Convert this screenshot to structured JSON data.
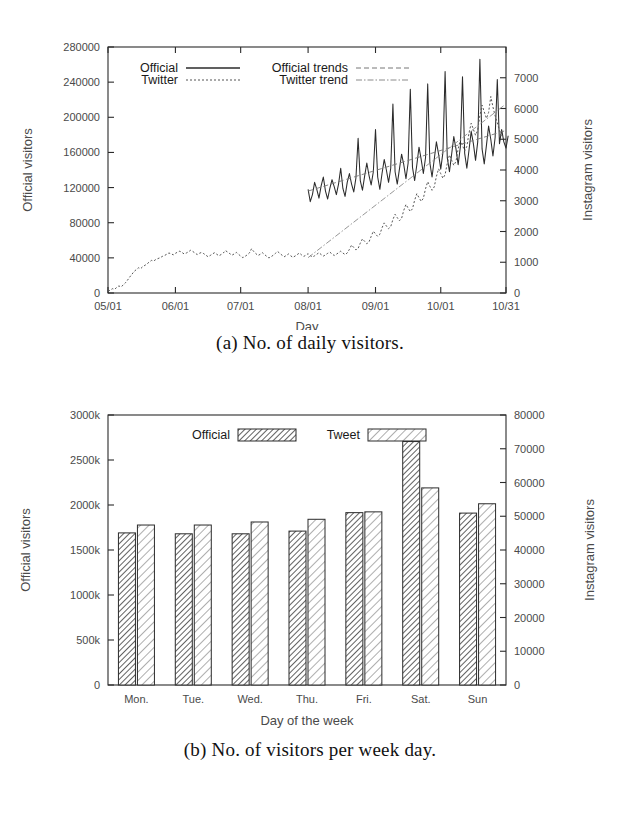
{
  "figure_a": {
    "caption": "(a) No. of daily visitors.",
    "legend": [
      {
        "label": "Official",
        "style": "solid"
      },
      {
        "label": "Twitter",
        "style": "dotted"
      },
      {
        "label": "Official trends",
        "style": "dashed"
      },
      {
        "label": "Twitter trend",
        "style": "dash-dot"
      }
    ],
    "chart_data": {
      "type": "line",
      "title": "",
      "xlabel": "Day",
      "ylabel": "Official visitors",
      "y2label": "Instagram visitors",
      "xtick_labels": [
        "05/01",
        "06/01",
        "07/01",
        "08/01",
        "09/01",
        "10/01",
        "10/31"
      ],
      "xtick_positions": [
        0,
        31,
        61,
        92,
        123,
        153,
        183
      ],
      "xlim": [
        0,
        183
      ],
      "ylim": [
        0,
        280000
      ],
      "ytick_labels": [
        "0",
        "40000",
        "80000",
        "120000",
        "160000",
        "200000",
        "240000",
        "280000"
      ],
      "ytick_values": [
        0,
        40000,
        80000,
        120000,
        160000,
        200000,
        240000,
        280000
      ],
      "y2lim": [
        0,
        8000
      ],
      "y2tick_labels": [
        "0",
        "1000",
        "2000",
        "3000",
        "4000",
        "5000",
        "6000",
        "7000"
      ],
      "y2tick_values": [
        0,
        1000,
        2000,
        3000,
        4000,
        5000,
        6000,
        7000
      ],
      "grid": false,
      "legend_position": "top-left-inside",
      "series": [
        {
          "name": "Official",
          "axis": "left",
          "style": "solid",
          "x_start": 92,
          "values": [
            118000,
            104000,
            112000,
            126000,
            118000,
            108000,
            122000,
            132000,
            116000,
            107000,
            119000,
            129000,
            121000,
            112000,
            124000,
            142000,
            119000,
            110000,
            126000,
            136000,
            124000,
            115000,
            131000,
            176000,
            128000,
            117000,
            133000,
            148000,
            134000,
            123000,
            138000,
            186000,
            132000,
            118000,
            136000,
            152000,
            140000,
            126000,
            142000,
            215000,
            138000,
            124000,
            141000,
            158000,
            146000,
            130000,
            148000,
            232000,
            143000,
            128000,
            146000,
            166000,
            152000,
            136000,
            154000,
            238000,
            148000,
            132000,
            152000,
            172000,
            158000,
            141000,
            160000,
            252000,
            154000,
            138000,
            158000,
            178000,
            164000,
            146000,
            166000,
            246000,
            159000,
            142000,
            163000,
            184000,
            170000,
            151000,
            172000,
            266000,
            164000,
            147000,
            168000,
            190000,
            175000,
            156000,
            177000,
            243000,
            170000,
            186000,
            172000,
            165000,
            179000
          ]
        },
        {
          "name": "Twitter",
          "axis": "right",
          "style": "dotted",
          "x_start": 0,
          "values": [
            60,
            90,
            140,
            120,
            180,
            230,
            200,
            260,
            330,
            420,
            520,
            610,
            700,
            760,
            820,
            790,
            860,
            900,
            950,
            1010,
            1060,
            1040,
            1090,
            1120,
            1150,
            1190,
            1220,
            1260,
            1300,
            1280,
            1240,
            1290,
            1330,
            1360,
            1320,
            1270,
            1300,
            1340,
            1390,
            1350,
            1300,
            1250,
            1290,
            1320,
            1280,
            1230,
            1180,
            1220,
            1270,
            1310,
            1260,
            1210,
            1250,
            1300,
            1380,
            1330,
            1280,
            1230,
            1270,
            1320,
            1260,
            1200,
            1150,
            1190,
            1240,
            1300,
            1440,
            1350,
            1280,
            1220,
            1260,
            1310,
            1250,
            1190,
            1140,
            1180,
            1230,
            1290,
            1350,
            1290,
            1230,
            1180,
            1220,
            1270,
            1210,
            1160,
            1200,
            1250,
            1300,
            1240,
            1190,
            1230,
            1280,
            1220,
            1170,
            1210,
            1260,
            1310,
            1250,
            1200,
            1240,
            1290,
            1330,
            1270,
            1220,
            1260,
            1310,
            1360,
            1300,
            1250,
            1300,
            1420,
            1560,
            1480,
            1400,
            1450,
            1620,
            1760,
            1680,
            1600,
            1660,
            1840,
            2010,
            1920,
            1840,
            1910,
            2120,
            2280,
            2180,
            2090,
            2160,
            2390,
            2560,
            2450,
            2350,
            2430,
            2690,
            2880,
            2760,
            2650,
            2740,
            3020,
            3230,
            3100,
            2980,
            3080,
            3390,
            3620,
            3470,
            3340,
            3450,
            3790,
            4040,
            3880,
            3730,
            3850,
            4220,
            4490,
            4320,
            4150,
            4280,
            4690,
            4980,
            4800,
            4620,
            4770,
            5210,
            5520,
            5320,
            5130,
            5300,
            5780,
            6110,
            5890,
            5680,
            5870,
            6390,
            6050,
            5760,
            5540,
            5290,
            5060
          ]
        }
      ],
      "trends": [
        {
          "name": "Official trends",
          "axis": "left",
          "style": "dashed",
          "x_start": 92,
          "x_end": 183,
          "y_start": 116000,
          "y_end": 185000
        },
        {
          "name": "Twitter trend",
          "axis": "right",
          "style": "dash-dot",
          "x_start": 92,
          "x_end": 183,
          "y_start": 1150,
          "y_end": 6150
        }
      ]
    }
  },
  "figure_b": {
    "caption": "(b) No. of visitors per week day.",
    "legend": [
      {
        "label": "Official",
        "pattern": "dense-hatch"
      },
      {
        "label": "Tweet",
        "pattern": "sparse-hatch"
      }
    ],
    "chart_data": {
      "type": "bar",
      "title": "",
      "xlabel": "Day of the week",
      "ylabel": "Official visitors",
      "y2label": "Instagram visitors",
      "categories": [
        "Mon.",
        "Tue.",
        "Wed.",
        "Thu.",
        "Fri.",
        "Sat.",
        "Sun"
      ],
      "ylim": [
        0,
        3000
      ],
      "ytick_labels": [
        "0",
        "500k",
        "1000k",
        "1500k",
        "2000k",
        "2500k",
        "3000k"
      ],
      "ytick_values": [
        0,
        500,
        1000,
        1500,
        2000,
        2500,
        3000
      ],
      "y2lim": [
        0,
        80000
      ],
      "y2tick_labels": [
        "0",
        "10000",
        "20000",
        "30000",
        "40000",
        "50000",
        "60000",
        "70000",
        "80000"
      ],
      "y2tick_values": [
        0,
        10000,
        20000,
        30000,
        40000,
        50000,
        60000,
        70000,
        80000
      ],
      "grid": false,
      "legend_position": "top-center-inside",
      "series": [
        {
          "name": "Official",
          "axis": "left",
          "unit": "k",
          "values": [
            1690,
            1680,
            1680,
            1710,
            1915,
            2705,
            1910
          ]
        },
        {
          "name": "Tweet",
          "axis": "right",
          "values": [
            47400,
            47400,
            48300,
            49100,
            51300,
            58400,
            53700
          ]
        }
      ]
    }
  }
}
